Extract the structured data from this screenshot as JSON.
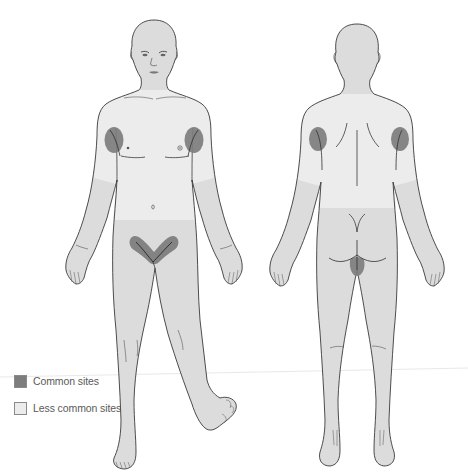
{
  "figure": {
    "type": "anatomical-body-map",
    "views": [
      {
        "id": "front",
        "label": "Anterior view",
        "common_sites": [
          "right-axilla",
          "left-axilla",
          "groin"
        ],
        "less_common_sites": [
          "chest",
          "upper-abdomen",
          "upper-arms"
        ]
      },
      {
        "id": "back",
        "label": "Posterior view",
        "common_sites": [
          "right-axilla",
          "left-axilla",
          "perineum"
        ],
        "less_common_sites": [
          "upper-back",
          "upper-arms"
        ]
      }
    ],
    "colors": {
      "common": "#7d7d7d",
      "less_common": "#ececec",
      "body": "#dcdcdc",
      "outline": "#3a3a3a",
      "background": "#ffffff"
    }
  },
  "legend": {
    "items": [
      {
        "label": "Common sites",
        "color": "#7d7d7d"
      },
      {
        "label": "Less common sites",
        "color": "#ececec"
      }
    ]
  }
}
